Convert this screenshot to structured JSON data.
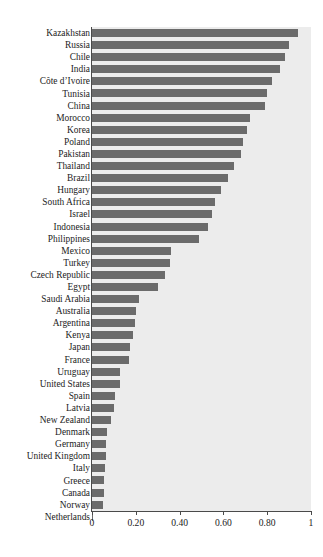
{
  "figure": {
    "top_clipped_text": "",
    "background_color": "#ffffff",
    "panel_color": "#ececec",
    "bar_color": "#6b6b6b",
    "axis_color": "#4a4a4a",
    "text_color": "#1c1c1c"
  },
  "chart_data": {
    "type": "bar",
    "orientation": "horizontal",
    "title": "",
    "subtitle": "",
    "xlabel": "",
    "ylabel": "",
    "xlim": [
      0,
      1
    ],
    "ylim": null,
    "grid": false,
    "legend": null,
    "legend_position": "none",
    "xticks": [
      0,
      0.2,
      0.4,
      0.6,
      0.8,
      1
    ],
    "xtick_labels": [
      "0",
      "0.20",
      "0.40",
      "0.60",
      "0.80",
      "1"
    ],
    "categories": [
      "Kazakhstan",
      "Russia",
      "Chile",
      "India",
      "Côte d’Ivoire",
      "Tunisia",
      "China",
      "Morocco",
      "Korea",
      "Poland",
      "Pakistan",
      "Thailand",
      "Brazil",
      "Hungary",
      "South Africa",
      "Israel",
      "Indonesia",
      "Philippines",
      "Mexico",
      "Turkey",
      "Czech Republic",
      "Egypt",
      "Saudi Arabia",
      "Australia",
      "Argentina",
      "Kenya",
      "Japan",
      "France",
      "Uruguay",
      "United States",
      "Spain",
      "Latvia",
      "New Zealand",
      "Denmark",
      "Germany",
      "United Kingdom",
      "Italy",
      "Greece",
      "Canada",
      "Norway",
      "Netherlands"
    ],
    "values": [
      0.94,
      0.9,
      0.88,
      0.86,
      0.82,
      0.8,
      0.79,
      0.72,
      0.71,
      0.69,
      0.68,
      0.65,
      0.62,
      0.59,
      0.56,
      0.55,
      0.53,
      0.49,
      0.36,
      0.355,
      0.335,
      0.3,
      0.215,
      0.2,
      0.195,
      0.185,
      0.175,
      0.17,
      0.13,
      0.128,
      0.105,
      0.1,
      0.088,
      0.068,
      0.066,
      0.064,
      0.058,
      0.057,
      0.056,
      0.048,
      0.005
    ]
  }
}
